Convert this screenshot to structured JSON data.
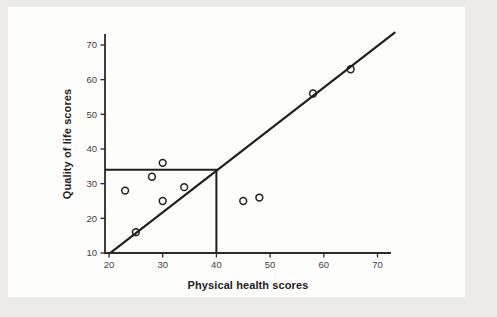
{
  "page": {
    "background_color": "#ecebe9",
    "card_color": "#fdfdfc"
  },
  "chart_data": {
    "type": "scatter",
    "title": "",
    "xlabel": "Physical health scores",
    "ylabel": "Quality of life scores",
    "xlim": [
      17,
      73.5
    ],
    "ylim": [
      10,
      75
    ],
    "x_ticks": [
      20,
      30,
      40,
      50,
      60,
      70
    ],
    "y_ticks": [
      10,
      20,
      30,
      40,
      50,
      60,
      70
    ],
    "grid": false,
    "legend": "none",
    "points": [
      {
        "x": 23,
        "y": 28
      },
      {
        "x": 25,
        "y": 16
      },
      {
        "x": 28,
        "y": 32
      },
      {
        "x": 30,
        "y": 25
      },
      {
        "x": 30,
        "y": 36
      },
      {
        "x": 34,
        "y": 29
      },
      {
        "x": 45,
        "y": 25
      },
      {
        "x": 48,
        "y": 26
      },
      {
        "x": 58,
        "y": 56
      },
      {
        "x": 65,
        "y": 63
      }
    ],
    "regression_line": {
      "slope": 1.2,
      "intercept": -14.3,
      "x_start": 20.2,
      "x_end": 73.2
    },
    "reference_lines": {
      "x": 40,
      "y": 34
    },
    "colors": {
      "line": "#221f1d",
      "point_stroke": "#221f1d",
      "axis": "#2c2926",
      "tick_label": "#45423f",
      "axis_label": "#25221f"
    }
  }
}
